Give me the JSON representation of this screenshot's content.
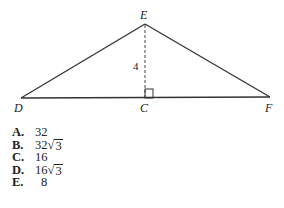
{
  "figure": {
    "vertices": {
      "D": "D",
      "E": "E",
      "F": "F",
      "C": "C"
    },
    "height_label": "4",
    "right_angle_at": "C"
  },
  "choices": [
    {
      "letter": "A.",
      "value": "32",
      "radical": ""
    },
    {
      "letter": "B.",
      "value": "32",
      "radical": "3"
    },
    {
      "letter": "C.",
      "value": "16",
      "radical": ""
    },
    {
      "letter": "D.",
      "value": "16",
      "radical": "3"
    },
    {
      "letter": "E.",
      "value": "8",
      "radical": ""
    }
  ]
}
